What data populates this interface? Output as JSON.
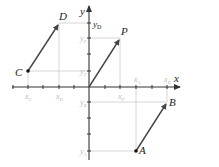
{
  "colors": {
    "axis": "#333333",
    "vector": "#444444",
    "guide": "#cccccc",
    "label": "#222222",
    "faint_label": "#bbbbbb"
  },
  "axes": {
    "x_label": "x",
    "y_label": "y"
  },
  "points": {
    "A": "A",
    "B": "B",
    "C": "C",
    "D": "D",
    "P": "P"
  },
  "y_ticks": {
    "yD": "y",
    "yD_sub": "D",
    "yP": "y",
    "yP_sub": "P",
    "yC": "y",
    "yC_sub": "C",
    "yB": "y",
    "yB_sub": "B",
    "yA": "y",
    "yA_sub": "A"
  },
  "x_ticks": {
    "xC": "x",
    "xC_sub": "C",
    "xD": "x",
    "xD_sub": "D",
    "xP": "x",
    "xP_sub": "P",
    "xA": "x",
    "xA_sub": "A",
    "xB": "x",
    "xB_sub": "B"
  },
  "vectors": [
    {
      "name": "CD",
      "from": "C",
      "to": "D"
    },
    {
      "name": "OP",
      "from": "O",
      "to": "P"
    },
    {
      "name": "AB",
      "from": "A",
      "to": "B"
    }
  ]
}
